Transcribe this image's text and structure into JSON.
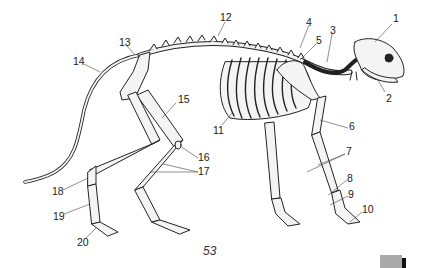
{
  "diagram": {
    "labels": [
      {
        "id": "1",
        "text": "1",
        "x": 393,
        "y": 18
      },
      {
        "id": "2",
        "text": "2",
        "x": 387,
        "y": 93
      },
      {
        "id": "3",
        "text": "3",
        "x": 331,
        "y": 27
      },
      {
        "id": "4",
        "text": "4",
        "x": 309,
        "y": 19
      },
      {
        "id": "5",
        "text": "5",
        "x": 316,
        "y": 37
      },
      {
        "id": "6",
        "text": "6",
        "x": 349,
        "y": 123
      },
      {
        "id": "7",
        "text": "7",
        "x": 346,
        "y": 150
      },
      {
        "id": "8",
        "text": "8",
        "x": 347,
        "y": 175
      },
      {
        "id": "9",
        "text": "9",
        "x": 348,
        "y": 191
      },
      {
        "id": "10",
        "text": "10",
        "x": 362,
        "y": 206
      },
      {
        "id": "11",
        "text": "11",
        "x": 215,
        "y": 127
      },
      {
        "id": "12",
        "text": "12",
        "x": 220,
        "y": 14
      },
      {
        "id": "13",
        "text": "13",
        "x": 119,
        "y": 38
      },
      {
        "id": "14",
        "text": "14",
        "x": 74,
        "y": 57
      },
      {
        "id": "15",
        "text": "15",
        "x": 178,
        "y": 96
      },
      {
        "id": "16",
        "text": "16",
        "x": 198,
        "y": 154
      },
      {
        "id": "17",
        "text": "17",
        "x": 198,
        "y": 167
      },
      {
        "id": "18",
        "text": "18",
        "x": 52,
        "y": 186
      },
      {
        "id": "19",
        "text": "19",
        "x": 54,
        "y": 212
      },
      {
        "id": "20",
        "text": "20",
        "x": 78,
        "y": 237
      }
    ]
  },
  "page": {
    "number": "53"
  },
  "colors": {
    "bone_fill": "#f4f4f4",
    "bone_stroke": "#222222",
    "tab": "#a9a9a9",
    "tab_bar": "#111111"
  }
}
